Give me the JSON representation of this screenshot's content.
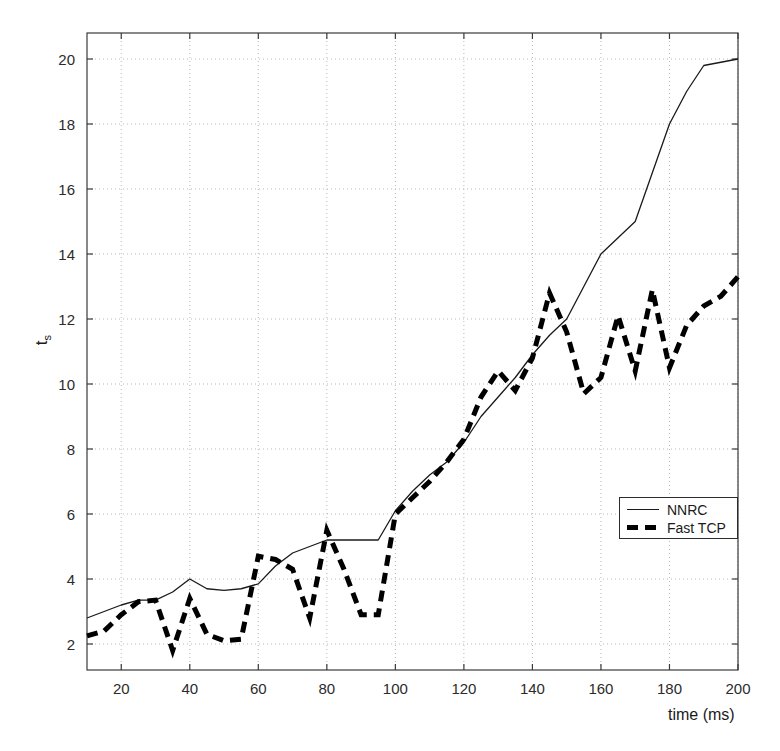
{
  "chart_data": {
    "type": "line",
    "title": "",
    "xlabel": "time (ms)",
    "ylabel": "t_s",
    "ylabel_base": "t",
    "ylabel_sub": "s",
    "xlim": [
      10,
      200
    ],
    "ylim": [
      1.2,
      20.8
    ],
    "xticks": [
      20,
      40,
      60,
      80,
      100,
      120,
      140,
      160,
      180,
      200
    ],
    "yticks": [
      2,
      4,
      6,
      8,
      10,
      12,
      14,
      16,
      18,
      20
    ],
    "grid": true,
    "grid_style": "dotted",
    "legend_position": "center-right",
    "series": [
      {
        "name": "NNRC",
        "style": "solid",
        "color": "#1a1a1a",
        "x": [
          10,
          15,
          20,
          25,
          30,
          35,
          40,
          45,
          50,
          55,
          60,
          65,
          70,
          75,
          80,
          85,
          90,
          95,
          100,
          105,
          110,
          115,
          120,
          125,
          130,
          135,
          140,
          145,
          150,
          155,
          160,
          165,
          170,
          175,
          180,
          185,
          190,
          195,
          200
        ],
        "y": [
          2.8,
          3.0,
          3.2,
          3.35,
          3.35,
          3.6,
          4.0,
          3.7,
          3.65,
          3.7,
          3.85,
          4.4,
          4.8,
          5.0,
          5.2,
          5.2,
          5.2,
          5.2,
          6.1,
          6.7,
          7.2,
          7.6,
          8.2,
          9.0,
          9.6,
          10.2,
          10.9,
          11.5,
          12.0,
          13.0,
          14.0,
          14.5,
          15.0,
          16.5,
          18.0,
          19.0,
          19.8,
          19.9,
          20.0
        ]
      },
      {
        "name": "Fast TCP",
        "style": "dashed",
        "color": "#000000",
        "x": [
          10,
          15,
          20,
          25,
          30,
          35,
          40,
          45,
          50,
          55,
          60,
          65,
          70,
          75,
          80,
          85,
          90,
          95,
          100,
          105,
          110,
          115,
          120,
          125,
          130,
          135,
          140,
          145,
          150,
          155,
          160,
          165,
          170,
          175,
          180,
          185,
          190,
          195,
          200
        ],
        "y": [
          2.25,
          2.4,
          2.9,
          3.3,
          3.35,
          1.8,
          3.4,
          2.3,
          2.1,
          2.15,
          4.7,
          4.6,
          4.3,
          2.8,
          5.5,
          4.3,
          2.9,
          2.9,
          6.0,
          6.5,
          7.0,
          7.6,
          8.3,
          9.6,
          10.4,
          9.8,
          10.8,
          12.8,
          11.6,
          9.7,
          10.2,
          12.1,
          10.4,
          12.9,
          10.5,
          11.8,
          12.4,
          12.7,
          13.3
        ]
      }
    ]
  },
  "legend": {
    "entries": [
      {
        "label": "NNRC",
        "style": "solid"
      },
      {
        "label": "Fast TCP",
        "style": "dashed"
      }
    ]
  }
}
